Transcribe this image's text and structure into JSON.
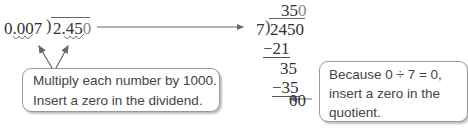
{
  "left_problem": {
    "divisor": "0.007",
    "dividend_main": "2.45",
    "dividend_zero": "0"
  },
  "callout_left": {
    "line1": "Multiply each number by 1000.",
    "line2": "Insert a zero in the dividend."
  },
  "long_division": {
    "quotient_main": "35",
    "quotient_zero": "0",
    "divisor": "7",
    "dividend": "2450",
    "step1_sub": "−21",
    "step2_rem": "35",
    "step3_sub": "−35",
    "final_rem": "00"
  },
  "callout_right": {
    "line1": "Because 0 ÷ 7 = 0,",
    "line2": "insert a zero in the",
    "line3": "quotient."
  }
}
